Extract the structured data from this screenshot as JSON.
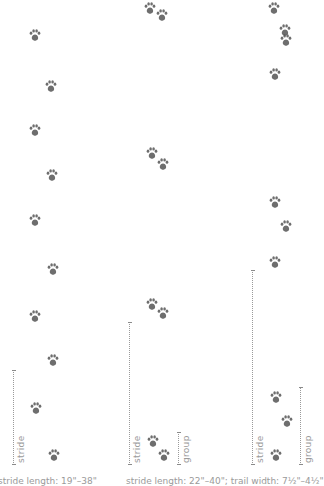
{
  "diagram": {
    "colors": {
      "paw": "#555555",
      "measure": "#9a9a9a"
    },
    "panels": [
      {
        "id": "left",
        "gait": "alternating walk",
        "paws": [
          [
            35,
            35
          ],
          [
            51,
            86
          ],
          [
            35,
            130
          ],
          [
            52,
            175
          ],
          [
            35,
            220
          ],
          [
            53,
            269
          ],
          [
            35,
            316
          ],
          [
            53,
            360
          ],
          [
            36,
            408
          ],
          [
            54,
            455
          ]
        ],
        "measures": [
          {
            "label": "stride",
            "x": 13,
            "top": 370,
            "bottom": 465
          }
        ],
        "caption": "stride length: 19\"–38\""
      },
      {
        "id": "middle",
        "gait": "paired lope",
        "paws": [
          [
            150,
            8
          ],
          [
            162,
            15
          ],
          [
            152,
            153
          ],
          [
            163,
            164
          ],
          [
            152,
            304
          ],
          [
            163,
            313
          ],
          [
            153,
            441
          ],
          [
            164,
            455
          ]
        ],
        "measures": [
          {
            "label": "stride",
            "x": 129,
            "top": 322,
            "bottom": 465
          },
          {
            "label": "group",
            "x": 178,
            "top": 432,
            "bottom": 465
          }
        ],
        "caption": "stride length: 22\"–40\"; trail width: 7½\"–4½\""
      },
      {
        "id": "right",
        "gait": "three-print lope",
        "paws": [
          [
            274,
            8
          ],
          [
            285,
            30
          ],
          [
            286,
            40
          ],
          [
            275,
            74
          ],
          [
            275,
            202
          ],
          [
            286,
            226
          ],
          [
            275,
            262
          ],
          [
            276,
            397
          ],
          [
            287,
            421
          ],
          [
            276,
            455
          ]
        ],
        "measures": [
          {
            "label": "stride",
            "x": 252,
            "top": 270,
            "bottom": 465
          },
          {
            "label": "group",
            "x": 300,
            "top": 387,
            "bottom": 465
          }
        ]
      }
    ],
    "captions": {
      "left": "stride length: 19\"–38\"",
      "right": "stride length: 22\"–40\"; trail width: 7½\"–4½\""
    },
    "icons": {
      "track": "paw-print-icon"
    }
  }
}
